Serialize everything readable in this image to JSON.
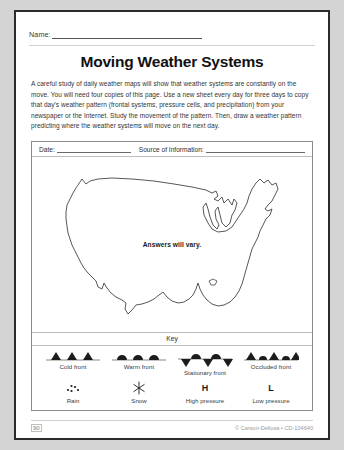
{
  "worksheet": {
    "name_label": "Name:",
    "title": "Moving Weather Systems",
    "intro": "A careful study of daily weather maps will show that weather systems are constantly on the move. You will need four copies of this page. Use a new sheet every day for three days to copy that day's weather pattern (frontal systems, pressure cells, and precipitation) from your newspaper or the Internet. Study the movement of the pattern. Then, draw a weather pattern predicting where the weather systems will move on the next day."
  },
  "sheet": {
    "date_label": "Date:",
    "source_label": "Source of Information:",
    "map_note": "Answers will vary.",
    "map_region": "united-states"
  },
  "key": {
    "title": "Key",
    "fronts": [
      {
        "name": "cold-front",
        "label": "Cold front",
        "symbol": "triangles-above-line"
      },
      {
        "name": "warm-front",
        "label": "Warm front",
        "symbol": "semicircles-above-line"
      },
      {
        "name": "stationary-front",
        "label": "Stationary front",
        "symbol": "semicircles-above-triangles-below"
      },
      {
        "name": "occluded-front",
        "label": "Occluded front",
        "symbol": "alternating-triangles-semicircles"
      }
    ],
    "symbols": [
      {
        "name": "rain",
        "label": "Rain",
        "glyph": "dots-cluster"
      },
      {
        "name": "snow",
        "label": "Snow",
        "glyph": "asterisk-star"
      },
      {
        "name": "high-pressure",
        "label": "High pressure",
        "glyph": "H"
      },
      {
        "name": "low-pressure",
        "label": "Low pressure",
        "glyph": "L"
      }
    ]
  },
  "footer": {
    "page_number": "90",
    "copyright": "© Carson-Dellosa • CD-104640"
  },
  "colors": {
    "page_background": "#ffffff",
    "frame_border": "#2b2b2b",
    "box_border": "#8c8c8c",
    "text": "#1a1a1a",
    "muted_text": "#9a9a9a"
  }
}
